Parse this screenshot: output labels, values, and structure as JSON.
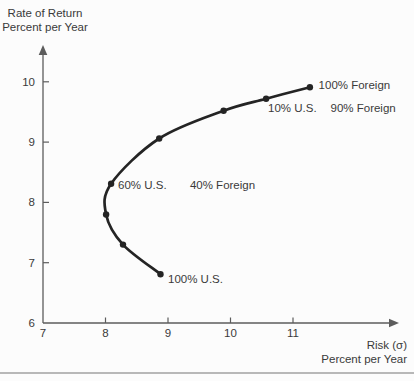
{
  "figure": {
    "y_axis_title_line1": "Rate of Return",
    "y_axis_title_line2": "Percent per Year",
    "x_axis_title_line1": "Risk (σ)",
    "x_axis_title_line2": "Percent per Year"
  },
  "colors": {
    "background": "#fcfcfc",
    "curve": "#242424",
    "axis": "#5c5c5c",
    "text": "#3a3a3a",
    "divider": "#b8b8b8"
  },
  "chart_data": {
    "type": "line",
    "xlabel": "Risk (σ) Percent per Year",
    "ylabel": "Rate of Return Percent per Year",
    "xlim": [
      7,
      12.7
    ],
    "ylim": [
      6,
      10.6
    ],
    "x_ticks": [
      7,
      8,
      9,
      10,
      11
    ],
    "y_ticks": [
      6,
      7,
      8,
      9,
      10
    ],
    "grid": false,
    "legend": false,
    "series": [
      {
        "name": "us-foreign-portfolio-frontier",
        "marker": "dot",
        "points": [
          {
            "x": 8.88,
            "y": 6.81,
            "label": "100% U.S."
          },
          {
            "x": 8.28,
            "y": 7.3,
            "label": ""
          },
          {
            "x": 8.01,
            "y": 7.8,
            "label": ""
          },
          {
            "x": 8.09,
            "y": 8.31,
            "label": "60% U.S. 40% Foreign"
          },
          {
            "x": 8.86,
            "y": 9.06,
            "label": ""
          },
          {
            "x": 9.89,
            "y": 9.52,
            "label": ""
          },
          {
            "x": 10.57,
            "y": 9.72,
            "label": "10% U.S. 90% Foreign"
          },
          {
            "x": 11.27,
            "y": 9.91,
            "label": "100% Foreign"
          }
        ]
      }
    ],
    "annotations": [
      {
        "text": "100% Foreign",
        "x": 11.41,
        "y": 9.88
      },
      {
        "text": "10% U.S.",
        "x": 10.6,
        "y": 9.5
      },
      {
        "text": "90% Foreign",
        "x": 11.6,
        "y": 9.5
      },
      {
        "text": "60% U.S.",
        "x": 8.2,
        "y": 8.22
      },
      {
        "text": "40% Foreign",
        "x": 9.35,
        "y": 8.22
      },
      {
        "text": "100% U.S.",
        "x": 9.0,
        "y": 6.66
      }
    ]
  }
}
